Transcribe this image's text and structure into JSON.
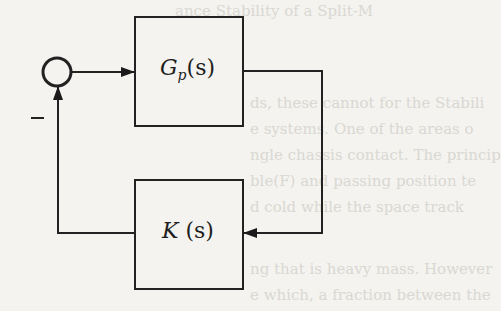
{
  "diagram": {
    "type": "feedback control block diagram",
    "blocks": [
      {
        "id": "plant",
        "label_main": "G",
        "label_sub": "p",
        "label_arg": "(s)",
        "position": "forward path"
      },
      {
        "id": "controller",
        "label_main": "K",
        "label_sub": "",
        "label_arg": " (s)",
        "position": "feedback path"
      }
    ],
    "summing_junction": {
      "feedback_sign": "–"
    },
    "connections": [
      {
        "from": "summing_junction",
        "to": "plant"
      },
      {
        "from": "plant",
        "to": "controller"
      },
      {
        "from": "controller",
        "to": "summing_junction",
        "sign": "-"
      }
    ],
    "colors": {
      "line": "#222222",
      "background": "#f4f3ef"
    }
  },
  "background_text": [
    "ance Stability of a Split-M",
    "ds, these cannot for the Stabili",
    "e systems. One of the areas o",
    "ngle chassis contact. The princip",
    "ble(F) and passing position te",
    "d cold while the space track",
    "ng that is heavy mass. However",
    "e which, a fraction between the"
  ]
}
